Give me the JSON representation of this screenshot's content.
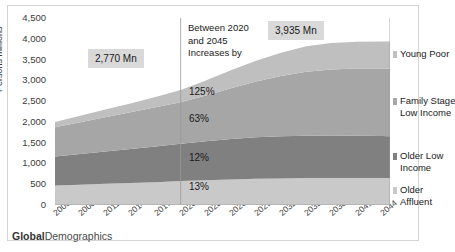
{
  "footer": {
    "brand_bold": "Global",
    "brand_rest": "Demographics"
  },
  "annotation": {
    "line1": "Between 2020",
    "line2": "and 2045",
    "line3": "Increases by"
  },
  "callouts": [
    {
      "name": "total-2020",
      "text": "2,770 Mn"
    },
    {
      "name": "total-2045",
      "text": "3,935 Mn"
    }
  ],
  "growth_labels": [
    {
      "segment": "Young Poor",
      "text": "125%"
    },
    {
      "segment": "Family Stage Low Income",
      "text": "63%"
    },
    {
      "segment": "Older Low Income",
      "text": "12%"
    },
    {
      "segment": "Older Affluent",
      "text": "13%"
    }
  ],
  "legend": [
    {
      "label_line1": "Young Poor",
      "label_line2": "",
      "color": "#bfbfbf"
    },
    {
      "label_line1": "Family Stage",
      "label_line2": "Low Income",
      "color": "#a6a6a6"
    },
    {
      "label_line1": "Older Low",
      "label_line2": "Income",
      "color": "#808080"
    },
    {
      "label_line1": "Older",
      "label_line2": "Affluent",
      "color": "#c9c9c9"
    }
  ],
  "chart_data": {
    "type": "area",
    "title": "",
    "xlabel": "",
    "ylabel": "Persons millions",
    "ylim": [
      0,
      4500
    ],
    "ytick_labels": [
      "4,500",
      "4,000",
      "3,500",
      "3,000",
      "2,500",
      "2,000",
      "1,500",
      "1,000",
      "500",
      "0"
    ],
    "yticks": [
      4500,
      4000,
      3500,
      3000,
      2500,
      2000,
      1500,
      1000,
      500,
      0
    ],
    "xlim": [
      2005,
      2045
    ],
    "xtick_labels": [
      "2005",
      "2008",
      "2011",
      "2014",
      "2017",
      "2020",
      "2023",
      "2026",
      "2029",
      "2032",
      "2035",
      "2038",
      "2041",
      "2044"
    ],
    "xticks": [
      2005,
      2008,
      2011,
      2014,
      2017,
      2020,
      2023,
      2026,
      2029,
      2032,
      2035,
      2038,
      2041,
      2044
    ],
    "grid": false,
    "stacked": true,
    "legend_position": "right",
    "marker_years": [
      2020,
      2045
    ],
    "x": [
      2005,
      2008,
      2011,
      2014,
      2017,
      2020,
      2023,
      2026,
      2029,
      2032,
      2035,
      2038,
      2041,
      2044,
      2045
    ],
    "series": [
      {
        "name": "Older Affluent",
        "color": "#c9c9c9",
        "values": [
          470,
          490,
          510,
          530,
          550,
          575,
          595,
          615,
          630,
          640,
          648,
          652,
          652,
          650,
          650
        ]
      },
      {
        "name": "Older Low Income",
        "color": "#808080",
        "values": [
          700,
          740,
          780,
          820,
          860,
          900,
          940,
          975,
          1000,
          1015,
          1020,
          1018,
          1012,
          1008,
          1007
        ]
      },
      {
        "name": "Family Stage Low Income",
        "color": "#a6a6a6",
        "values": [
          700,
          760,
          820,
          880,
          940,
          1000,
          1100,
          1220,
          1340,
          1450,
          1540,
          1590,
          1620,
          1628,
          1630
        ]
      },
      {
        "name": "Young Poor",
        "color": "#bfbfbf",
        "values": [
          130,
          160,
          190,
          215,
          250,
          295,
          360,
          430,
          500,
          560,
          610,
          640,
          645,
          648,
          648
        ]
      }
    ],
    "totals": [
      2000,
      2150,
      2300,
      2445,
      2600,
      2770,
      2995,
      3240,
      3470,
      3665,
      3818,
      3900,
      3929,
      3934,
      3935
    ],
    "annotations": [
      {
        "text": "2,770 Mn",
        "at_year": 2020
      },
      {
        "text": "3,935 Mn",
        "at_year": 2045
      },
      {
        "text": "125%",
        "segment": "Young Poor"
      },
      {
        "text": "63%",
        "segment": "Family Stage Low Income"
      },
      {
        "text": "12%",
        "segment": "Older Low Income"
      },
      {
        "text": "13%",
        "segment": "Older Affluent"
      }
    ]
  }
}
